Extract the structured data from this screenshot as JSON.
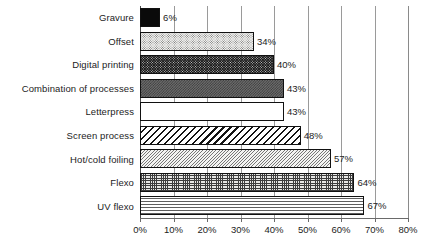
{
  "chart_data": {
    "type": "bar",
    "orientation": "horizontal",
    "title": "",
    "subtitle": "",
    "xlabel": "",
    "ylabel": "",
    "xlim": [
      0,
      80
    ],
    "xtick_values": [
      0,
      10,
      20,
      30,
      40,
      50,
      60,
      70,
      80
    ],
    "xtick_labels": [
      "0%",
      "10%",
      "20%",
      "30%",
      "40%",
      "50%",
      "60%",
      "70%",
      "80%"
    ],
    "grid": "vertical",
    "legend": "none",
    "value_label_suffix": "%",
    "categories": [
      "Gravure",
      "Offset",
      "Digital printing",
      "Combination of processes",
      "Letterpress",
      "Screen process",
      "Hot/cold foiling",
      "Flexo",
      "UV flexo"
    ],
    "values": [
      6,
      34,
      40,
      43,
      43,
      48,
      57,
      64,
      67
    ],
    "value_labels": [
      "6%",
      "34%",
      "40%",
      "43%",
      "43%",
      "48%",
      "57%",
      "64%",
      "67%"
    ],
    "bars": [
      {
        "label": "Gravure",
        "value": 6,
        "value_label": "6%",
        "pattern": "solid-black"
      },
      {
        "label": "Offset",
        "value": 34,
        "value_label": "34%",
        "pattern": "light-dots"
      },
      {
        "label": "Digital printing",
        "value": 40,
        "value_label": "40%",
        "pattern": "dark-dots"
      },
      {
        "label": "Combination of processes",
        "value": 43,
        "value_label": "43%",
        "pattern": "gray-check"
      },
      {
        "label": "Letterpress",
        "value": 43,
        "value_label": "43%",
        "pattern": "white"
      },
      {
        "label": "Screen process",
        "value": 48,
        "value_label": "48%",
        "pattern": "bold-diagonal"
      },
      {
        "label": "Hot/cold foiling",
        "value": 57,
        "value_label": "57%",
        "pattern": "fine-diagonal"
      },
      {
        "label": "Flexo",
        "value": 64,
        "value_label": "64%",
        "pattern": "crosshatch"
      },
      {
        "label": "UV flexo",
        "value": 67,
        "value_label": "67%",
        "pattern": "horizontal-lines"
      }
    ],
    "colors": {
      "background": "#ffffff",
      "gridline": "#9a9a9a",
      "axis": "#4a4a4a",
      "bar_outline": "#111111",
      "text": "#1c1c1c"
    }
  }
}
